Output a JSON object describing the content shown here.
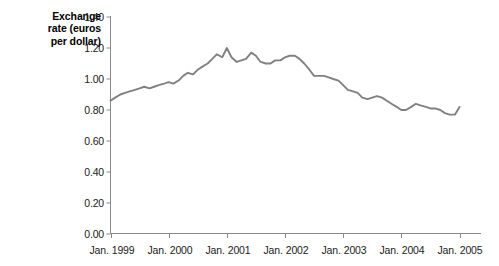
{
  "chart_data": {
    "type": "line",
    "title": "",
    "ylabel": "Exchange rate (euros per dollar)",
    "ylabel_lines": [
      "Exchange",
      "rate (euros",
      "per dollar)"
    ],
    "xlabel": "",
    "ylim": [
      0.0,
      1.4
    ],
    "yticks": [
      "0.00",
      "0.20",
      "0.40",
      "0.60",
      "0.80",
      "1.00",
      "1.20",
      "1.40"
    ],
    "ytick_values": [
      0.0,
      0.2,
      0.4,
      0.6,
      0.8,
      1.0,
      1.2,
      1.4
    ],
    "xticks": [
      "Jan. 1999",
      "Jan. 2000",
      "Jan. 2001",
      "Jan. 2002",
      "Jan. 2003",
      "Jan. 2004",
      "Jan. 2005"
    ],
    "xtick_values": [
      1999.0,
      2000.0,
      2001.0,
      2002.0,
      2003.0,
      2004.0,
      2005.0
    ],
    "xlim": [
      1999.0,
      2005.0
    ],
    "grid": false,
    "legend": "none",
    "series": [
      {
        "name": "Exchange rate (euros per dollar)",
        "color": "#808080",
        "x": [
          1999.0,
          1999.08,
          1999.17,
          1999.25,
          1999.33,
          1999.42,
          1999.5,
          1999.58,
          1999.67,
          1999.75,
          1999.83,
          1999.92,
          2000.0,
          2000.08,
          2000.17,
          2000.25,
          2000.33,
          2000.42,
          2000.5,
          2000.58,
          2000.67,
          2000.75,
          2000.83,
          2000.92,
          2001.0,
          2001.08,
          2001.17,
          2001.25,
          2001.33,
          2001.42,
          2001.5,
          2001.58,
          2001.67,
          2001.75,
          2001.83,
          2001.92,
          2002.0,
          2002.08,
          2002.17,
          2002.25,
          2002.33,
          2002.42,
          2002.5,
          2002.58,
          2002.67,
          2002.75,
          2002.83,
          2002.92,
          2003.0,
          2003.08,
          2003.17,
          2003.25,
          2003.33,
          2003.42,
          2003.5,
          2003.58,
          2003.67,
          2003.75,
          2003.83,
          2003.92,
          2004.0,
          2004.08,
          2004.17,
          2004.25,
          2004.33,
          2004.42,
          2004.5,
          2004.58,
          2004.67,
          2004.75,
          2004.83,
          2004.92,
          2005.0
        ],
        "y": [
          0.86,
          0.88,
          0.9,
          0.91,
          0.92,
          0.93,
          0.94,
          0.95,
          0.94,
          0.95,
          0.96,
          0.97,
          0.98,
          0.97,
          0.99,
          1.02,
          1.04,
          1.03,
          1.06,
          1.08,
          1.1,
          1.13,
          1.16,
          1.14,
          1.2,
          1.14,
          1.11,
          1.12,
          1.13,
          1.17,
          1.15,
          1.11,
          1.1,
          1.1,
          1.12,
          1.12,
          1.14,
          1.15,
          1.15,
          1.13,
          1.1,
          1.06,
          1.02,
          1.02,
          1.02,
          1.01,
          1.0,
          0.99,
          0.96,
          0.93,
          0.92,
          0.91,
          0.88,
          0.87,
          0.88,
          0.89,
          0.88,
          0.86,
          0.84,
          0.82,
          0.8,
          0.8,
          0.82,
          0.84,
          0.83,
          0.82,
          0.81,
          0.81,
          0.8,
          0.78,
          0.77,
          0.77,
          0.82
        ]
      }
    ]
  },
  "axis_style": {
    "line_color": "#8a8a8a",
    "tick_color": "#8a8a8a"
  }
}
